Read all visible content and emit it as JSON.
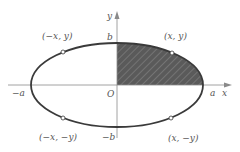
{
  "diagram": {
    "type": "ellipse-quadrant",
    "colors": {
      "axis": "#8a8a8a",
      "curve": "#3a3a3a",
      "shade": "#5a5a5a",
      "hatch": "#7a7a7a",
      "label": "#555555"
    },
    "axes": {
      "x_label": "x",
      "y_label": "y",
      "origin_label": "O"
    },
    "intercepts": {
      "pos_a": "a",
      "neg_a": "−a",
      "pos_b": "b",
      "neg_b": "−b"
    },
    "points": [
      {
        "label": "(x, y)",
        "quadrant": "I"
      },
      {
        "label": "(−x, y)",
        "quadrant": "II"
      },
      {
        "label": "(−x, −y)",
        "quadrant": "III"
      },
      {
        "label": "(x, −y)",
        "quadrant": "IV"
      }
    ],
    "shaded_region": "first-quadrant"
  }
}
